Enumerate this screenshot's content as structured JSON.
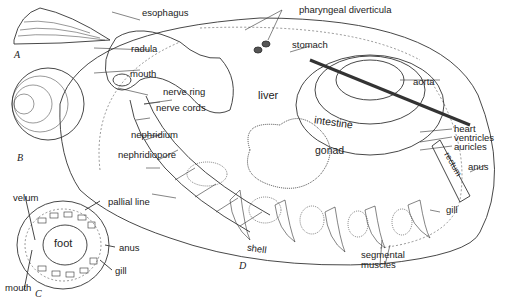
{
  "figures": {
    "A": "A",
    "B": "B",
    "C": "C",
    "D": "D"
  },
  "labels_c": {
    "velum": "velum",
    "foot": "foot",
    "mouth": "mouth",
    "pallial_line": "pallial line",
    "anus": "anus",
    "gill": "gill"
  },
  "labels_d": {
    "esophagus": "esophagus",
    "pharyngeal_diverticula": "pharyngeal diverticula",
    "stomach": "stomach",
    "radula": "radula",
    "mouth": "mouth",
    "nerve_ring": "nerve ring",
    "nerve_cords": "nerve cords",
    "liver": "liver",
    "aorta": "aorta",
    "intestine": "intestine",
    "nephridium": "nephridium",
    "nephridiopore": "nephridiopore",
    "gonad": "gonad",
    "heart": "heart",
    "ventricles": "ventricles",
    "auricles": "auricles",
    "rectum": "rectum",
    "anus": "anus",
    "gill": "gill",
    "shell": "shell",
    "segmental": "segmental",
    "muscles": "muscles"
  }
}
